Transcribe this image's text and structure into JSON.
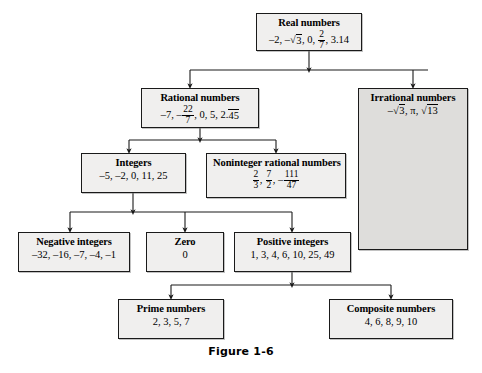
{
  "figure": {
    "caption": "Figure 1-6",
    "background_color": "#ffffff",
    "box_fill_color": "#f0efee",
    "shaded_box_fill_color": "#dedddb",
    "line_color": "#1a1a1a"
  },
  "nodes": {
    "real": {
      "title": "Real numbers",
      "examples_plain": "-2, -√3, 0, 2/7, 3.14",
      "examples_parts": {
        "before": "–2, –",
        "sqrt": "3",
        "middle": ", 0, ",
        "frac_num": "2",
        "frac_den": "7",
        "after": ", 3.14"
      }
    },
    "rational": {
      "title": "Rational numbers",
      "examples_plain": "-7, -22/7, 0, 5, 2.45 (repeating)",
      "examples_parts": {
        "before": "–7, –",
        "frac_num": "22",
        "frac_den": "7",
        "middle": ", 0, 5, 2.",
        "repeat": "45"
      }
    },
    "irrational": {
      "title": "Irrational numbers",
      "examples_plain": "-√3, π, √13",
      "examples_parts": {
        "before": "–",
        "sqrt1": "3",
        "middle": ", π, ",
        "sqrt2": "13"
      }
    },
    "integers": {
      "title": "Integers",
      "examples_plain": "–5, –2, 0, 11, 25"
    },
    "noninteger": {
      "title": "Noninteger rational numbers",
      "examples_plain": "2/3, 7/2, -111/47",
      "examples_parts": {
        "f1_num": "2",
        "f1_den": "3",
        "sep1": ", ",
        "f2_num": "7",
        "f2_den": "2",
        "sep2": ", –",
        "f3_num": "111",
        "f3_den": "47"
      }
    },
    "negative_integers": {
      "title": "Negative integers",
      "examples_plain": "–32, –16, –7, –4, –1"
    },
    "zero": {
      "title": "Zero",
      "examples_plain": "0"
    },
    "positive_integers": {
      "title": "Positive integers",
      "examples_plain": "1, 3, 4, 6, 10, 25, 49"
    },
    "prime": {
      "title": "Prime numbers",
      "examples_plain": "2, 3, 5, 7"
    },
    "composite": {
      "title": "Composite numbers",
      "examples_plain": "4, 6, 8, 9, 10"
    }
  },
  "edges": [
    {
      "from": "real",
      "to": "rational"
    },
    {
      "from": "real",
      "to": "irrational"
    },
    {
      "from": "rational",
      "to": "integers"
    },
    {
      "from": "rational",
      "to": "noninteger"
    },
    {
      "from": "integers",
      "to": "negative_integers"
    },
    {
      "from": "integers",
      "to": "zero"
    },
    {
      "from": "integers",
      "to": "positive_integers"
    },
    {
      "from": "positive_integers",
      "to": "prime"
    },
    {
      "from": "positive_integers",
      "to": "composite"
    }
  ]
}
